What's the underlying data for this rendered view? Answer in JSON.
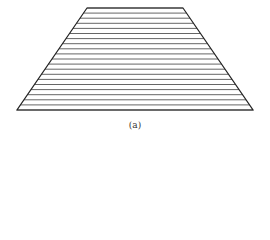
{
  "figure": {
    "caption": "(a)",
    "shape": "trapezoid",
    "top_left": [
      87,
      8
    ],
    "top_right": [
      183,
      8
    ],
    "bottom_left": [
      17,
      110
    ],
    "bottom_right": [
      253,
      110
    ],
    "hatch_line_count": 21,
    "outline_color": "#222222",
    "hatch_color": "#555555"
  }
}
